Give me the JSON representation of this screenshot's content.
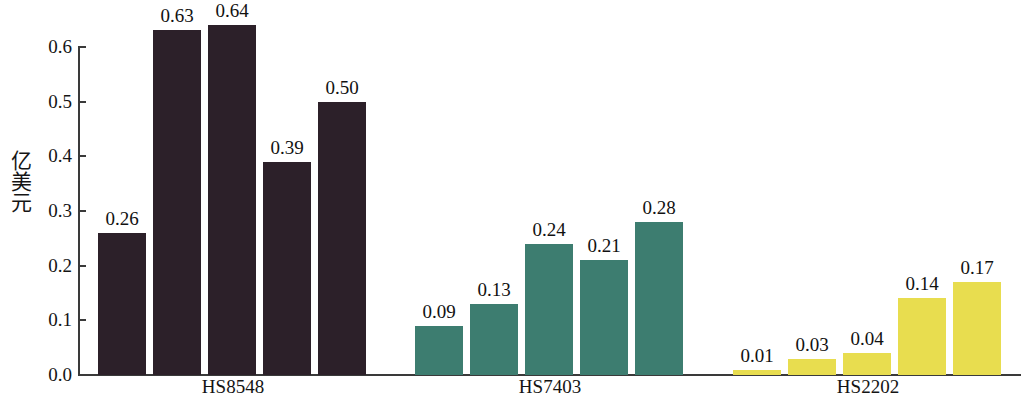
{
  "chart_data": {
    "type": "bar",
    "title": "",
    "subtitle": "",
    "xlabel": "",
    "ylabel": "亿美元",
    "ylim": [
      0.0,
      0.65
    ],
    "y_ticks": [
      "0.0",
      "0.1",
      "0.2",
      "0.3",
      "0.4",
      "0.5",
      "0.6"
    ],
    "y_tick_values": [
      0.0,
      0.1,
      0.2,
      0.3,
      0.4,
      0.5,
      0.6
    ],
    "grid": false,
    "legend": false,
    "legend_position": "none",
    "categories": [
      "HS8548",
      "HS7403",
      "HS2202"
    ],
    "bars_per_category": 5,
    "groups": [
      {
        "label": "HS8548",
        "color": "#2c2029",
        "values": [
          0.26,
          0.63,
          0.64,
          0.39,
          0.5
        ],
        "value_labels": [
          "0.26",
          "0.63",
          "0.64",
          "0.39",
          "0.50"
        ]
      },
      {
        "label": "HS7403",
        "color": "#3d7d70",
        "values": [
          0.09,
          0.13,
          0.24,
          0.21,
          0.28
        ],
        "value_labels": [
          "0.09",
          "0.13",
          "0.24",
          "0.21",
          "0.28"
        ]
      },
      {
        "label": "HS2202",
        "color": "#e8dd4f",
        "values": [
          0.01,
          0.03,
          0.04,
          0.14,
          0.17
        ],
        "value_labels": [
          "0.01",
          "0.03",
          "0.04",
          "0.14",
          "0.17"
        ]
      }
    ],
    "colors": {
      "group_1": "#2c2029",
      "group_2": "#3d7d70",
      "group_3": "#e8dd4f",
      "axis": "#3a3a3a",
      "text": "#141414",
      "background": "#ffffff"
    }
  },
  "layout": {
    "baseline_y": 375,
    "axis_left_x": 78,
    "pixels_per_unit": 547,
    "bar_width": 48,
    "bar_gap": 7,
    "group_start_x": [
      98,
      415,
      733
    ],
    "group_label_center_x": [
      233,
      550,
      868
    ]
  }
}
